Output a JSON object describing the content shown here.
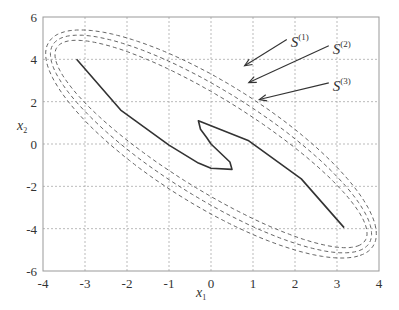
{
  "chart_data": {
    "type": "line",
    "title": "",
    "xlabel": "x1",
    "ylabel": "x2",
    "xlim": [
      -4,
      4
    ],
    "ylim": [
      -6,
      6
    ],
    "xticks": [
      -4,
      -3,
      -2,
      -1,
      0,
      1,
      2,
      3,
      4
    ],
    "yticks": [
      -6,
      -4,
      -2,
      0,
      2,
      4,
      6
    ],
    "grid": true,
    "series": [
      {
        "name": "trajectory",
        "style": "solid",
        "points": [
          [
            -3.2,
            4.0
          ],
          [
            -2.15,
            1.6
          ],
          [
            -1.0,
            -0.05
          ],
          [
            -0.3,
            -0.9
          ],
          [
            0.0,
            -1.15
          ],
          [
            0.5,
            -1.2
          ],
          [
            0.45,
            -0.85
          ],
          [
            0.0,
            0.0
          ],
          [
            -0.1,
            0.3
          ],
          [
            -0.25,
            0.7
          ],
          [
            -0.3,
            1.1
          ],
          [
            0.9,
            0.15
          ],
          [
            2.15,
            -1.65
          ],
          [
            3.17,
            -3.95
          ]
        ]
      },
      {
        "name": "S(1)",
        "style": "dashed",
        "ellipse": {
          "cx": 0.0,
          "cy": 0.0,
          "a": 6.35,
          "b": 2.05,
          "angle_deg": -56
        }
      },
      {
        "name": "S(2)",
        "style": "dashed",
        "ellipse": {
          "cx": 0.0,
          "cy": 0.0,
          "a": 6.15,
          "b": 1.8,
          "angle_deg": -55
        }
      },
      {
        "name": "S(3)",
        "style": "dashed",
        "ellipse": {
          "cx": 0.0,
          "cy": 0.0,
          "a": 5.95,
          "b": 1.55,
          "angle_deg": -54
        }
      }
    ],
    "annotations": [
      {
        "label": "S",
        "sup": "(1)",
        "text_pos": [
          1.9,
          4.75
        ],
        "arrow_to": [
          0.8,
          3.7
        ]
      },
      {
        "label": "S",
        "sup": "(2)",
        "text_pos": [
          2.9,
          4.45
        ],
        "arrow_to": [
          0.9,
          2.9
        ]
      },
      {
        "label": "S",
        "sup": "(3)",
        "text_pos": [
          2.9,
          2.7
        ],
        "arrow_to": [
          1.15,
          2.1
        ]
      }
    ]
  },
  "plot_box": {
    "left": 43,
    "right": 379,
    "top": 17,
    "bottom": 271
  }
}
